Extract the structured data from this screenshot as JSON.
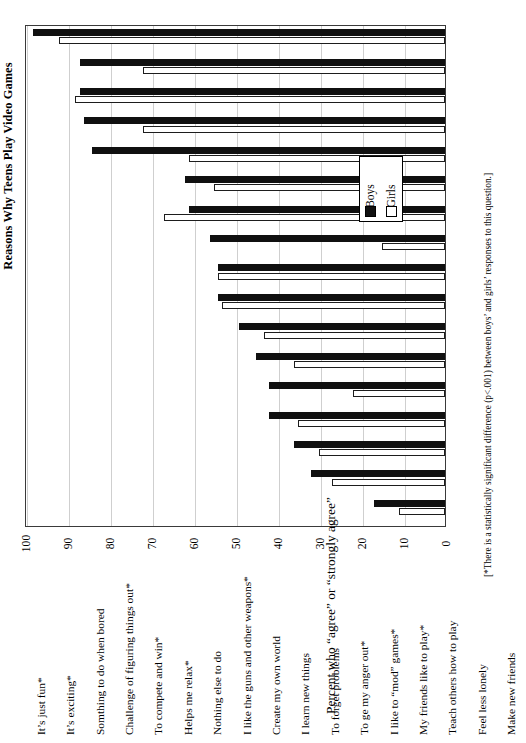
{
  "chart_data": {
    "type": "bar",
    "title": "Reasons Why Teens Play Video Games",
    "orientation": "vertical-bars-rotated-page",
    "xlabel": "",
    "ylabel": "Percent who “agree” or “strongly agree”",
    "ylim": [
      0,
      100
    ],
    "ytick_step": 10,
    "yticks": [
      "0",
      "10",
      "20",
      "30",
      "40",
      "50",
      "60",
      "70",
      "80",
      "90",
      "100"
    ],
    "grid": true,
    "legend_position": "inside-upper-right",
    "footnote": "[*There is a statistically significant difference (p<.001) between boys’ and girls’ responses to this question.]",
    "categories": [
      "It’s just fun*",
      "It’s exciting*",
      "Somthing to do when bored",
      "Challenge of figuring things out*",
      "To compete and win*",
      "Helps me relax*",
      "Nothing else to do",
      "I like the guns and other weapons*",
      "Create my own world",
      "I learn new things",
      "To forget problems",
      "To ge my anger out*",
      "I like to “mod” games*",
      "My friends like to play*",
      "Teach others how to play",
      "Feel less lonely",
      "Make new friends"
    ],
    "series": [
      {
        "name": "Boys",
        "color": "#101010",
        "values": [
          98,
          87,
          87,
          86,
          84,
          62,
          61,
          56,
          54,
          54,
          49,
          45,
          42,
          42,
          36,
          32,
          17
        ]
      },
      {
        "name": "Girls",
        "color": "#ffffff",
        "values": [
          92,
          72,
          88,
          72,
          61,
          55,
          67,
          15,
          54,
          53,
          43,
          36,
          22,
          35,
          30,
          27,
          11
        ]
      }
    ]
  },
  "legend": {
    "entries": [
      {
        "label": "Boys",
        "swatch": "filled-square"
      },
      {
        "label": "Girls",
        "swatch": "open-square"
      }
    ]
  }
}
